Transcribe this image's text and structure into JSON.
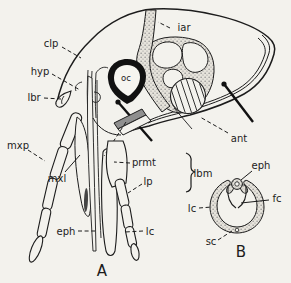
{
  "colors": {
    "paper": "#f3f2ed",
    "ink": "#1c1c1c",
    "stipple_bg": "#e6e3db",
    "stipple_dot": "#8c8c8c",
    "dark_bar": "#8f8f8f"
  },
  "panelA": {
    "caption": "A",
    "labels": {
      "clp": "clp",
      "hyp": "hyp",
      "lbr": "lbr",
      "mxp": "mxp",
      "mxl": "mxl",
      "oc": "oc",
      "iar": "iar",
      "ant": "ant",
      "prmt": "prmt",
      "lp": "lp",
      "lbm": "lbm",
      "eph": "eph",
      "lc": "lc"
    }
  },
  "panelB": {
    "caption": "B",
    "labels": {
      "eph": "eph",
      "fc": "fc",
      "lc": "lc",
      "sc": "sc"
    }
  }
}
